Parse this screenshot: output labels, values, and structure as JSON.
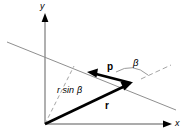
{
  "figure": {
    "colors": {
      "stroke_dark": "#000000",
      "stroke_light": "#8a8a8a",
      "stroke_dashed": "#9a9a9a",
      "background": "#ffffff"
    },
    "axes": {
      "y_label": "y",
      "x_label": "x",
      "origin": {
        "x": 45,
        "y": 124
      }
    },
    "labels": {
      "vector_p": "p",
      "vector_r": "r",
      "projection": "r sin",
      "projection_greek": "β",
      "angle": "β"
    },
    "geometry": {
      "r_tip": {
        "x": 131,
        "y": 83
      },
      "p_tip": {
        "x": 88,
        "y": 72
      },
      "line_start": {
        "x": 7,
        "y": 42
      },
      "line_end": {
        "x": 176,
        "y": 110
      },
      "ray_start": {
        "x": 141,
        "y": 79
      },
      "ray_end": {
        "x": 170,
        "y": 66
      },
      "dashed_top": {
        "x": 74,
        "y": 67
      }
    }
  }
}
